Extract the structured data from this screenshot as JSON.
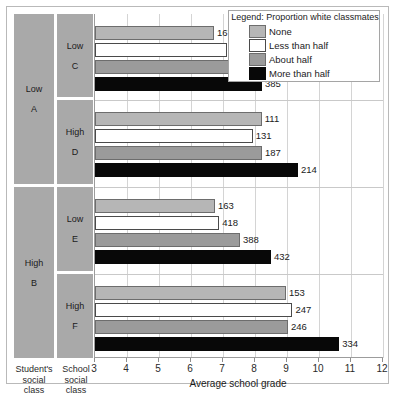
{
  "chart_data": {
    "type": "bar",
    "orientation": "horizontal",
    "title": "",
    "xlabel": "Average school grade",
    "ylabel": "",
    "xlim": [
      3,
      12
    ],
    "xticks": [
      3,
      4,
      5,
      6,
      7,
      8,
      9,
      10,
      11,
      12
    ],
    "grid": "vertical",
    "legend": {
      "title": "Legend: Proportion white classmates",
      "position": "top-right",
      "entries": [
        {
          "label": "None",
          "color": "#b6b6b6"
        },
        {
          "label": "Less than half",
          "color": "#ffffff"
        },
        {
          "label": "About half",
          "color": "#9b9b9b"
        },
        {
          "label": "More than half",
          "color": "#080808"
        }
      ]
    },
    "series": [
      {
        "name": "None",
        "values": [
          6.72,
          8.21,
          6.75,
          8.97
        ]
      },
      {
        "name": "Less than half",
        "values": [
          7.13,
          7.93,
          6.88,
          9.17
        ]
      },
      {
        "name": "About half",
        "values": [
          7.45,
          8.22,
          7.53,
          9.03
        ]
      },
      {
        "name": "More than half",
        "values": [
          8.22,
          9.34,
          8.5,
          10.63
        ]
      }
    ],
    "data_labels": {
      "None": [
        "167",
        "111",
        "163",
        "153"
      ],
      "Less than half": [
        "410",
        "131",
        "418",
        "247"
      ],
      "About half": [
        "345",
        "187",
        "388",
        "246"
      ],
      "More than half": [
        "385",
        "214",
        "432",
        "334"
      ]
    },
    "groups": [
      {
        "student_class": "Low\nA",
        "school_class_line1": "Low",
        "school_class_line2": "C"
      },
      {
        "student_class": "Low\nA",
        "school_class_line1": "High",
        "school_class_line2": "D"
      },
      {
        "student_class": "High\nB",
        "school_class_line1": "Low",
        "school_class_line2": "E"
      },
      {
        "student_class": "High\nB",
        "school_class_line1": "High",
        "school_class_line2": "F"
      }
    ]
  },
  "axes": {
    "x_title": "Average school grade",
    "tick_labels": [
      "3",
      "4",
      "5",
      "6",
      "7",
      "8",
      "9",
      "10",
      "11",
      "12"
    ]
  },
  "columns": {
    "student": {
      "caption_l1": "Student's",
      "caption_l2": "social",
      "caption_l3": "class"
    },
    "school": {
      "caption_l1": "School",
      "caption_l2": "social",
      "caption_l3": "class"
    }
  },
  "student_bands": [
    {
      "l1": "Low",
      "l2": "A"
    },
    {
      "l1": "High",
      "l2": "B"
    }
  ],
  "school_bands": [
    {
      "l1": "Low",
      "l2": "C"
    },
    {
      "l1": "High",
      "l2": "D"
    },
    {
      "l1": "Low",
      "l2": "E"
    },
    {
      "l1": "High",
      "l2": "F"
    }
  ],
  "legend": {
    "title": "Legend: Proportion white classmates",
    "items": [
      {
        "label": "None"
      },
      {
        "label": "Less than half"
      },
      {
        "label": "About half"
      },
      {
        "label": "More than half"
      }
    ]
  },
  "bars": [
    {
      "group": 0,
      "series": 0,
      "value_label": "167",
      "grade": 6.72
    },
    {
      "group": 0,
      "series": 1,
      "value_label": "410",
      "grade": 7.13
    },
    {
      "group": 0,
      "series": 2,
      "value_label": "345",
      "grade": 7.45
    },
    {
      "group": 0,
      "series": 3,
      "value_label": "385",
      "grade": 8.22
    },
    {
      "group": 1,
      "series": 0,
      "value_label": "111",
      "grade": 8.21
    },
    {
      "group": 1,
      "series": 1,
      "value_label": "131",
      "grade": 7.93
    },
    {
      "group": 1,
      "series": 2,
      "value_label": "187",
      "grade": 8.22
    },
    {
      "group": 1,
      "series": 3,
      "value_label": "214",
      "grade": 9.34
    },
    {
      "group": 2,
      "series": 0,
      "value_label": "163",
      "grade": 6.75
    },
    {
      "group": 2,
      "series": 1,
      "value_label": "418",
      "grade": 6.88
    },
    {
      "group": 2,
      "series": 2,
      "value_label": "388",
      "grade": 7.53
    },
    {
      "group": 2,
      "series": 3,
      "value_label": "432",
      "grade": 8.5
    },
    {
      "group": 3,
      "series": 0,
      "value_label": "153",
      "grade": 8.97
    },
    {
      "group": 3,
      "series": 1,
      "value_label": "247",
      "grade": 9.17
    },
    {
      "group": 3,
      "series": 2,
      "value_label": "246",
      "grade": 9.03
    },
    {
      "group": 3,
      "series": 3,
      "value_label": "334",
      "grade": 10.63
    }
  ],
  "footer": {
    "cut_off_note": ""
  }
}
